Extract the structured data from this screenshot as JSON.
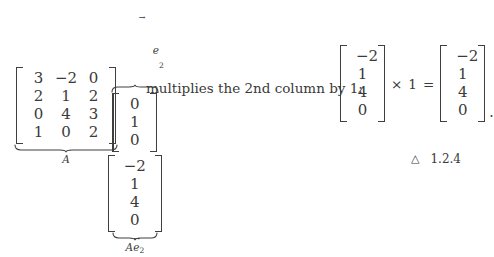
{
  "equation": {
    "matrix_A": {
      "label": "A",
      "rows": [
        [
          "3",
          "−2",
          "0"
        ],
        [
          "2",
          "1",
          "2"
        ],
        [
          "0",
          "4",
          "3"
        ],
        [
          "1",
          "0",
          "2"
        ]
      ]
    },
    "vector_e2": {
      "label_base": "e",
      "label_subscript": "2",
      "label_accent": "→",
      "values": [
        "0",
        "1",
        "0"
      ]
    },
    "vector_Ae2": {
      "label_prefix": "A",
      "label_base": "e",
      "label_subscript": "2",
      "label_accent": "→",
      "values": [
        "−2",
        "1",
        "4",
        "0"
      ]
    },
    "description": "multiplies the 2nd column by 1:",
    "rhs": {
      "left_vector": [
        "−2",
        "1",
        "4",
        "0"
      ],
      "times_operator": "×",
      "scalar": "1",
      "equals_operator": "=",
      "result_vector": [
        "−2",
        "1",
        "4",
        "0"
      ],
      "terminator": "."
    }
  },
  "footer": {
    "marker": "△",
    "number": "1.2.4"
  },
  "colors": {
    "text": "#3a3a3a",
    "rule": "#3f3f3f",
    "background": "#ffffff"
  }
}
